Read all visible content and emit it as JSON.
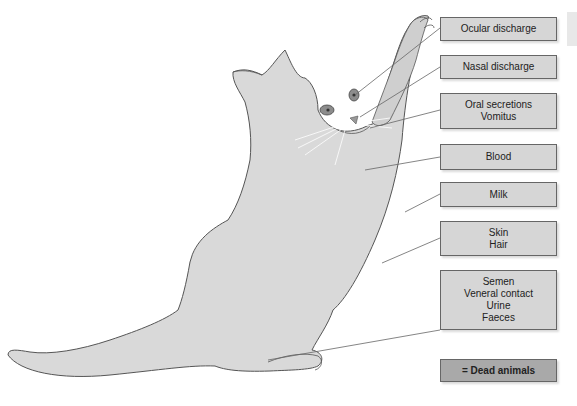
{
  "diagram": {
    "colors": {
      "cat_fill": "#d9d9d9",
      "cat_outline": "#555555",
      "box_fill": "#d6d6d6",
      "dead_box_fill": "#a9a9a9",
      "leader_line": "#666666"
    },
    "labels": [
      {
        "lines": [
          "Ocular discharge"
        ]
      },
      {
        "lines": [
          "Nasal discharge"
        ]
      },
      {
        "lines": [
          "Oral secretions",
          "Vomitus"
        ]
      },
      {
        "lines": [
          "Blood"
        ]
      },
      {
        "lines": [
          "Milk"
        ]
      },
      {
        "lines": [
          "Skin",
          "Hair"
        ]
      },
      {
        "lines": [
          "Semen",
          "Veneral contact",
          "Urine",
          "Faeces"
        ]
      }
    ],
    "legend": {
      "label": "= Dead animals"
    }
  }
}
